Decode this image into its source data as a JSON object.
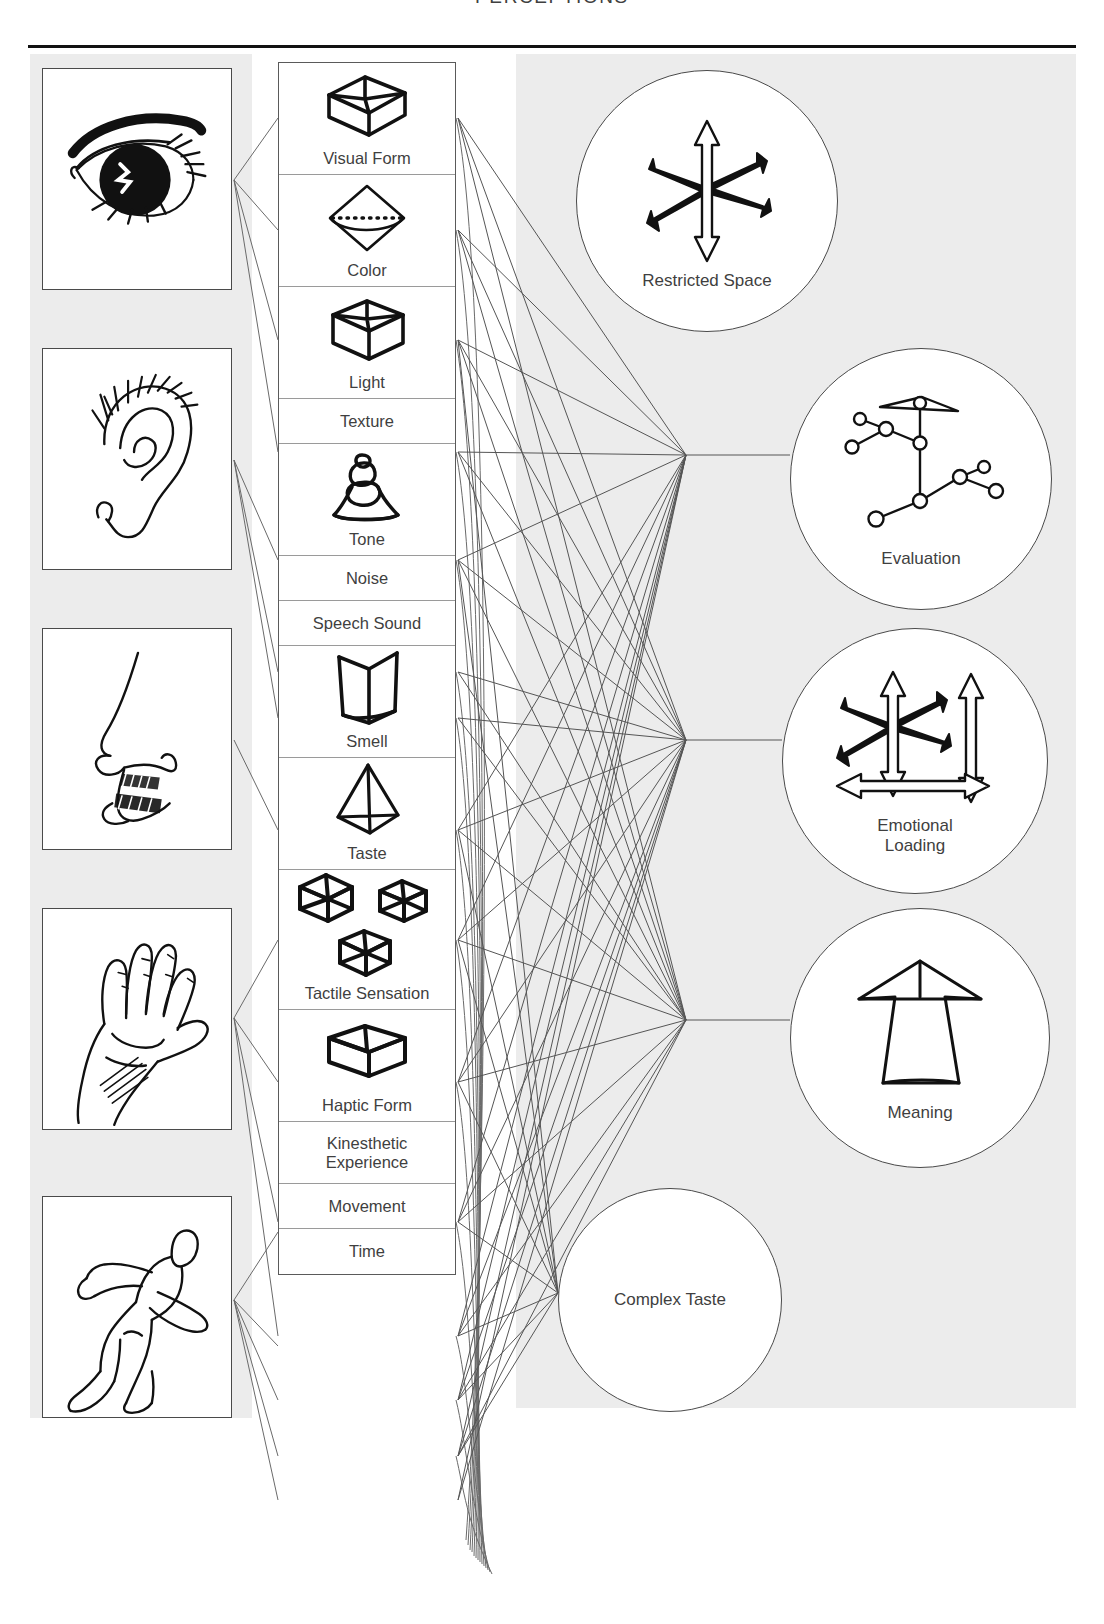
{
  "header": {
    "title": "PERCEPTIONS"
  },
  "sense_organs": [
    {
      "name": "eye",
      "icon": "eye-drawing"
    },
    {
      "name": "ear",
      "icon": "ear-drawing"
    },
    {
      "name": "nose",
      "icon": "nose-drawing"
    },
    {
      "name": "hand",
      "icon": "hand-drawing"
    },
    {
      "name": "body",
      "icon": "running-figure-drawing"
    }
  ],
  "perceptions": [
    {
      "label": "Visual Form",
      "icon": "wireframe-cube-icon",
      "size": "tall"
    },
    {
      "label": "Color",
      "icon": "octahedron-dotted-icon",
      "size": "tall"
    },
    {
      "label": "Light",
      "icon": "wireframe-box-icon",
      "size": "tall"
    },
    {
      "label": "Texture",
      "icon": "none",
      "size": "short"
    },
    {
      "label": "Tone",
      "icon": "bell-shape-icon",
      "size": "tall"
    },
    {
      "label": "Noise",
      "icon": "none",
      "size": "short"
    },
    {
      "label": "Speech Sound",
      "icon": "none",
      "size": "short"
    },
    {
      "label": "Smell",
      "icon": "open-prism-icon",
      "size": "tall"
    },
    {
      "label": "Taste",
      "icon": "tetrahedron-icon",
      "size": "tall"
    },
    {
      "label": "Tactile Sensation",
      "icon": "three-cubes-icon",
      "size": "xtall"
    },
    {
      "label": "Haptic Form",
      "icon": "flat-cube-icon",
      "size": "tall"
    },
    {
      "label": "Kinesthetic\nExperience",
      "icon": "none",
      "size": "two-line"
    },
    {
      "label": "Movement",
      "icon": "none",
      "size": "short"
    },
    {
      "label": "Time",
      "icon": "none",
      "size": "short"
    }
  ],
  "outcomes": [
    {
      "label": "Restricted Space",
      "icon": "multi-arrow-burst-icon"
    },
    {
      "label": "Evaluation",
      "icon": "node-network-icon"
    },
    {
      "label": "Emotional\nLoading",
      "icon": "arrow-burst-axes-icon"
    },
    {
      "label": "Meaning",
      "icon": "big-up-arrow-icon"
    },
    {
      "label": "Complex Taste",
      "icon": "none"
    }
  ],
  "colors": {
    "panel_gray": "#ececec",
    "line_gray": "#5a5a5a",
    "ink": "#111111",
    "text": "#3f3f3f"
  }
}
